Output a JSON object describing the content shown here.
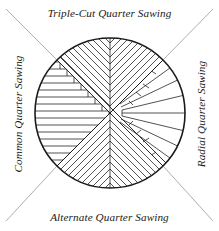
{
  "figure": {
    "background_color": "#ffffff",
    "line_color": "#1a1a1a",
    "text_color": "#1a1a1a"
  },
  "labels": {
    "top": "Triple-Cut Quarter Sawing",
    "bottom": "Alternate Quarter Sawing",
    "left": "Common Quarter Sawing",
    "right": "Radial Quarter Sawing"
  },
  "diagram": {
    "shape": "circle",
    "center_x": 110,
    "center_y": 113,
    "radius": 75,
    "quadrant_count": 4,
    "divider": "diagonal-x-cross",
    "quadrants": [
      {
        "name": "triple-cut-quarter-sawing",
        "position": "top",
        "pattern": "herringbone-chevron",
        "label_ref": "labels.top"
      },
      {
        "name": "radial-quarter-sawing",
        "position": "right",
        "pattern": "radial-fan-wedges",
        "label_ref": "labels.right"
      },
      {
        "name": "alternate-quarter-sawing",
        "position": "bottom",
        "pattern": "herringbone-chevron",
        "label_ref": "labels.bottom"
      },
      {
        "name": "common-quarter-sawing",
        "position": "left",
        "pattern": "horizontal-stacked-boards",
        "label_ref": "labels.left"
      }
    ],
    "leader_lines": [
      {
        "name": "leader-top-left",
        "from": [
          53,
          56
        ],
        "to": [
          5,
          8
        ]
      },
      {
        "name": "leader-top-right",
        "from": [
          167,
          56
        ],
        "to": [
          214,
          8
        ]
      },
      {
        "name": "leader-bottom-left",
        "from": [
          53,
          170
        ],
        "to": [
          5,
          222
        ]
      },
      {
        "name": "leader-bottom-right",
        "from": [
          167,
          170
        ],
        "to": [
          214,
          222
        ]
      }
    ]
  }
}
